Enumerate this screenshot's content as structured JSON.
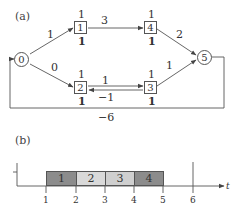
{
  "panel_a": {
    "label": "(a)",
    "nodes": [
      {
        "id": "0",
        "shape": "circle"
      },
      {
        "id": "1",
        "shape": "box",
        "top": "1",
        "bottom": "1"
      },
      {
        "id": "4",
        "shape": "box",
        "top": "1",
        "bottom": "1"
      },
      {
        "id": "2",
        "shape": "box",
        "top": "1",
        "bottom": "1"
      },
      {
        "id": "3",
        "shape": "box",
        "top": "1",
        "bottom": "1"
      },
      {
        "id": "5",
        "shape": "circle"
      }
    ],
    "edges": [
      {
        "from": "0",
        "to": "1",
        "weight": "1"
      },
      {
        "from": "0",
        "to": "2",
        "weight": "0"
      },
      {
        "from": "1",
        "to": "4",
        "weight": "3"
      },
      {
        "from": "2",
        "to": "3",
        "weight": "1"
      },
      {
        "from": "3",
        "to": "2",
        "weight": "−1"
      },
      {
        "from": "4",
        "to": "5",
        "weight": "2"
      },
      {
        "from": "3",
        "to": "5",
        "weight": "1"
      },
      {
        "from": "5",
        "to": "0",
        "weight": "−6"
      }
    ]
  },
  "panel_b": {
    "label": "(b)",
    "axis_label": "t",
    "ticks": [
      "1",
      "2",
      "3",
      "4",
      "5",
      "6"
    ],
    "bars": [
      {
        "label": "1",
        "start": 1,
        "end": 2,
        "color": "#8c8c8c"
      },
      {
        "label": "2",
        "start": 2,
        "end": 3,
        "color": "#d9d9d9"
      },
      {
        "label": "3",
        "start": 3,
        "end": 4,
        "color": "#cfcfcf"
      },
      {
        "label": "4",
        "start": 4,
        "end": 5,
        "color": "#8c8c8c"
      }
    ]
  }
}
